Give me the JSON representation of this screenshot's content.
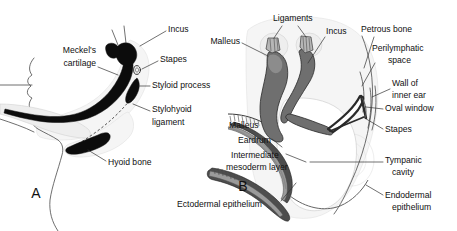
{
  "figure": {
    "background_color": "#ffffff",
    "width": 457,
    "height": 231
  },
  "palette": {
    "label_text": "#101010",
    "leader_line": "#333333",
    "ossicle_gray": "#6f6f6f",
    "ossicle_light_gray": "#b6b6b6",
    "bone_black": "#0c0c0c",
    "tint_pale": "#eeeeee",
    "membrane_gray": "#4d4d4d",
    "outline": "#4a4a4a"
  },
  "panels": [
    {
      "id": "panel-a",
      "letter": "A",
      "letter_x": 36,
      "letter_y": 194,
      "description": "Sagittal view of fetal head profile showing Meckel's cartilage, ossicles, styloid process, stylohyoid ligament and hyoid bone",
      "labels": [
        {
          "id": "incus",
          "text": "Incus",
          "x": 168,
          "y": 30,
          "anchor": "start",
          "leader": "M 166 31 L 140 46"
        },
        {
          "id": "meckels-cartilage",
          "text": "Meckel's",
          "text2": "cartilage",
          "x": 96,
          "y": 56,
          "anchor": "end",
          "leader": "M 98 66 L 116 73"
        },
        {
          "id": "stapes",
          "text": "Stapes",
          "x": 160,
          "y": 60,
          "anchor": "start",
          "leader": "M 158 61 L 141 70"
        },
        {
          "id": "styloid-process",
          "text": "Styloid process",
          "x": 152,
          "y": 86,
          "anchor": "start",
          "leader": "M 150 86 L 138 86"
        },
        {
          "id": "stylohyoid-ligament",
          "text": "Stylohyoid",
          "text2": "ligament",
          "x": 152,
          "y": 114,
          "anchor": "start",
          "leader": "M 150 113 L 134 105"
        },
        {
          "id": "hyoid-bone",
          "text": "Hyoid bone",
          "x": 108,
          "y": 163,
          "anchor": "start",
          "leader": "M 106 162 L 88 151"
        }
      ]
    },
    {
      "id": "panel-b",
      "letter": "B",
      "letter_x": 243,
      "letter_y": 187,
      "description": "Enlarged view of the middle ear showing malleus, incus, stapes, eardrum, tympanic cavity and surrounding epithelia",
      "labels": [
        {
          "id": "ligaments",
          "text": "Ligaments",
          "x": 273,
          "y": 19,
          "anchor": "start",
          "leader": "M 282 25 L 280 43"
        },
        {
          "id": "ligaments-leader2",
          "text": "",
          "leader": "M 296 25 L 306 42"
        },
        {
          "id": "incus",
          "text": "Incus",
          "x": 326,
          "y": 32,
          "anchor": "start",
          "leader": "M 325 35 L 306 62"
        },
        {
          "id": "petrous-bone",
          "text": "Petrous bone",
          "x": 361,
          "y": 30,
          "anchor": "start",
          "leader": "M 372 36 L 366 67"
        },
        {
          "id": "perilymphatic-space",
          "text": "Perilymphatic",
          "text2": "space",
          "x": 372,
          "y": 49,
          "anchor": "start",
          "leader": "M 374 62 L 362 86"
        },
        {
          "id": "malleus-top",
          "text": "Malleus",
          "x": 240,
          "y": 42,
          "anchor": "end",
          "leader": "M 242 43 L 266 56"
        },
        {
          "id": "wall-of-inner-ear",
          "text": "Wall of",
          "text2": "inner ear",
          "x": 392,
          "y": 84,
          "anchor": "start",
          "leader": "M 390 89 L 373 97"
        },
        {
          "id": "oval-window",
          "text": "Oval window",
          "x": 385,
          "y": 109,
          "anchor": "start",
          "leader": "M 383 109 L 368 108"
        },
        {
          "id": "stapes",
          "text": "Stapes",
          "x": 385,
          "y": 130,
          "anchor": "start",
          "leader": "M 383 129 L 366 116"
        },
        {
          "id": "malleus-lower",
          "text": "Malleus",
          "x": 229,
          "y": 126,
          "anchor": "start",
          "leader": ""
        },
        {
          "id": "eardrum",
          "text": "Eardrum",
          "x": 238,
          "y": 141,
          "anchor": "start",
          "leader": "M 272 140 L 280 147"
        },
        {
          "id": "intermediate-mesoderm-layer",
          "text": "Intermediate",
          "text2": "mesoderm layer",
          "x": 226,
          "y": 156,
          "anchor": "start",
          "leader": "M 305 162 L 345 162"
        },
        {
          "id": "tympanic-cavity",
          "text": "Tympanic",
          "text2": "cavity",
          "x": 385,
          "y": 161,
          "anchor": "start",
          "leader": "M 383 162 L 348 162"
        },
        {
          "id": "ectodermal-epithelium",
          "text": "Ectodermal epithelium",
          "x": 177,
          "y": 205,
          "anchor": "start",
          "leader": "M 280 200 L 300 180"
        },
        {
          "id": "endodermal-epithelium",
          "text": "Endodermal",
          "text2": "epithelium",
          "x": 385,
          "y": 196,
          "anchor": "start",
          "leader": "M 383 194 L 368 186"
        }
      ]
    }
  ]
}
